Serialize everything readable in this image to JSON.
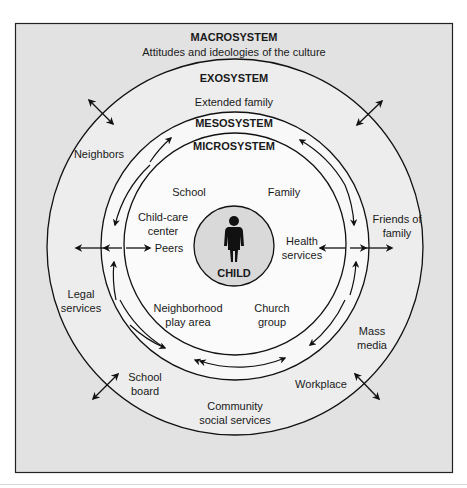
{
  "diagram": {
    "title": "MACROSYSTEM",
    "subtitle": "Attitudes and ideologies of the culture",
    "systems": {
      "macrosystem": "MACROSYSTEM",
      "exosystem": "EXOSYSTEM",
      "mesosystem": "MESOSYSTEM",
      "microsystem": "MICROSYSTEM",
      "center": "CHILD"
    },
    "exosystem_items": {
      "extended_family": "Extended family",
      "neighbors": "Neighbors",
      "friends_1": "Friends of",
      "friends_2": "family",
      "legal_1": "Legal",
      "legal_2": "services",
      "mass_1": "Mass",
      "mass_2": "media",
      "school_board_1": "School",
      "school_board_2": "board",
      "workplace": "Workplace",
      "community_1": "Community",
      "community_2": "social services"
    },
    "microsystem_items": {
      "school": "School",
      "family": "Family",
      "childcare_1": "Child-care",
      "childcare_2": "center",
      "peers": "Peers",
      "health_1": "Health",
      "health_2": "services",
      "neighborhood_1": "Neighborhood",
      "neighborhood_2": "play area",
      "church_1": "Church",
      "church_2": "group"
    },
    "colors": {
      "macro_bg": "#e2e2e2",
      "exo_bg": "#ededed",
      "micro_bg": "#f7f7f7",
      "child_bg": "#d9d9d9",
      "line": "#111111"
    }
  }
}
